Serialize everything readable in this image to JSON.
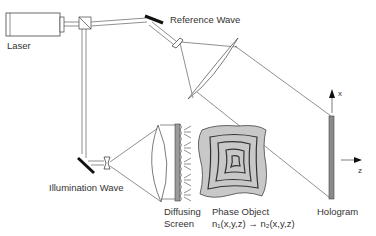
{
  "diagram": {
    "labels": {
      "laser": "Laser",
      "reference_wave": "Reference Wave",
      "illumination_wave": "Illumination Wave",
      "diffusing_screen_line1": "Diffusing",
      "diffusing_screen_line2": "Screen",
      "phase_object": "Phase Object",
      "phase_formula": "n₁(x,y,z) → n₂(x,y,z)",
      "hologram": "Hologram",
      "axis_x": "x",
      "axis_z": "z"
    },
    "colors": {
      "line": "#444444",
      "mirror": "#111111",
      "phase_object_fill": "#c8c8c8",
      "hologram_fill": "#8a8a8a",
      "text": "#333333"
    }
  }
}
